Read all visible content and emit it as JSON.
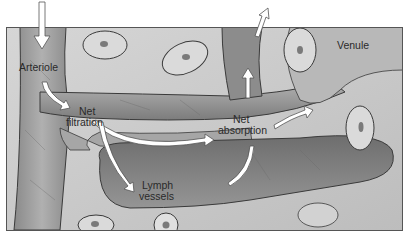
{
  "figure": {
    "labels": {
      "arteriole": "Arteriole",
      "net_filtration_line1": "Net",
      "net_filtration_line2": "filtration",
      "net_absorption_line1": "Net",
      "net_absorption_line2": "absorption",
      "lymph_line1": "Lymph",
      "lymph_line2": "vessels",
      "venule": "Venule"
    },
    "colors": {
      "background": "#ffffff",
      "tissue": "#c8c8c8",
      "tissue_light": "#dcdcdc",
      "vessel": "#9a9a9a",
      "vessel_dark": "#7e7e7e",
      "lymph": "#8a8a8a",
      "outline": "#3a3a3a",
      "arrow": "#ffffff"
    }
  }
}
